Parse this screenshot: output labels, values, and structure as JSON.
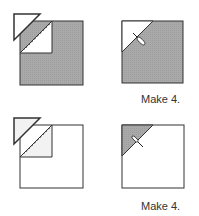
{
  "diagram": {
    "type": "quilt-block-instructions",
    "steps": [
      {
        "row": 1,
        "left": {
          "description": "Gray square with white square placed on top-left corner, stitched diagonally; trimmed triangle shown removed",
          "square_fill": "gray",
          "corner_fill": "white"
        },
        "right": {
          "description": "Result: gray square with white triangle on top-left corner, seam pressed",
          "caption": "Make 4."
        }
      },
      {
        "row": 2,
        "left": {
          "description": "White square with gray square placed on top-left corner, stitched diagonally; trimmed triangle shown removed",
          "square_fill": "white",
          "corner_fill": "light-gray"
        },
        "right": {
          "description": "Result: white square with gray triangle on top-left corner, seam pressed",
          "caption": "Make 4."
        }
      }
    ]
  },
  "colors": {
    "gray_fill": "#a9a9a9",
    "light_fill": "#f2f2f2",
    "outline": "#333333",
    "background": "#ffffff"
  }
}
